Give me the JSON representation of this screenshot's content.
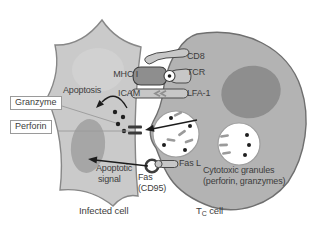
{
  "figure": {
    "cells": {
      "infected": {
        "label": "Infected cell"
      },
      "tc": {
        "label_t": "T",
        "label_sub": "C",
        "label_cell": " cell"
      }
    },
    "receptors": {
      "cd8": "CD8",
      "tcr": "TCR",
      "mhc1": "MHC I",
      "icam": "ICAM",
      "lfa1": "LFA-1",
      "fas_l": "Fas L",
      "fas": "Fas",
      "cd95": "(CD95)"
    },
    "processes": {
      "apoptosis": "Apoptosis",
      "granzyme": "Granzyme",
      "perforin": "Perforin",
      "apoptotic_signal_1": "Apoptotic",
      "apoptotic_signal_2": "signal",
      "granules_1": "Cytotoxic granules",
      "granules_2": "(perforin, granzymes)"
    },
    "colors": {
      "infected_body": "#cacaca",
      "infected_nucleus": "#a6a6a6",
      "tc_body": "#b3b3b3",
      "tc_nucleus": "#8e8e8e",
      "granule_fill": "#ffffff",
      "receptor_fill": "#c7c7c7",
      "mhc_fill": "#8e8e8e",
      "outline": "#4a4a4a",
      "arrow": "#1c1c1c",
      "text": "#3d3d3d"
    }
  }
}
